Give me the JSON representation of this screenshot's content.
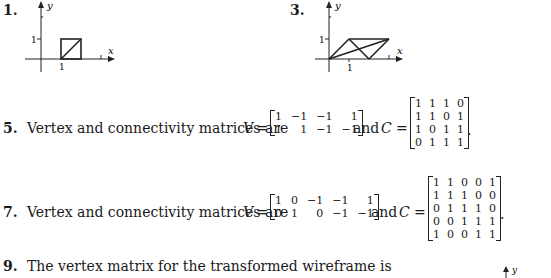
{
  "problems": [
    {
      "number": "1.",
      "figure": {
        "x_label": "x",
        "y_label": "y",
        "x_tick": "1",
        "y_tick": "1",
        "description": "unit square from (1,0) to (2,1) with diagonal"
      }
    },
    {
      "number": "3.",
      "figure": {
        "x_label": "x",
        "y_label": "y",
        "x_tick": "1",
        "y_tick": "1",
        "description": "wireframe with vertices (0,0), (1,1), (3,1), (2,0)"
      }
    },
    {
      "number": "5.",
      "text": "Vertex and connectivity matrices are",
      "v_label": "V",
      "equals": "=",
      "and_text": "and",
      "c_label": "C",
      "end_punct": ".",
      "V": [
        [
          "1",
          "−1",
          "−1",
          "1"
        ],
        [
          "1",
          "1",
          "−1",
          "−1"
        ]
      ],
      "C": [
        [
          "1",
          "1",
          "1",
          "0"
        ],
        [
          "1",
          "1",
          "0",
          "1"
        ],
        [
          "1",
          "0",
          "1",
          "1"
        ],
        [
          "0",
          "1",
          "1",
          "1"
        ]
      ]
    },
    {
      "number": "7.",
      "text": "Vertex and connectivity matrices are",
      "v_label": "V",
      "equals": "=",
      "and_text": "and",
      "c_label": "C",
      "end_punct": ".",
      "V": [
        [
          "1",
          "0",
          "−1",
          "−1",
          "1"
        ],
        [
          "0",
          "1",
          "0",
          "−1",
          "−1"
        ]
      ],
      "C": [
        [
          "1",
          "1",
          "0",
          "0",
          "1"
        ],
        [
          "1",
          "1",
          "1",
          "0",
          "0"
        ],
        [
          "0",
          "1",
          "1",
          "1",
          "0"
        ],
        [
          "0",
          "0",
          "1",
          "1",
          "1"
        ],
        [
          "1",
          "0",
          "0",
          "1",
          "1"
        ]
      ]
    },
    {
      "number": "9.",
      "text": "The vertex matrix for the transformed wireframe is",
      "figure": {
        "y_label": "y"
      }
    }
  ]
}
